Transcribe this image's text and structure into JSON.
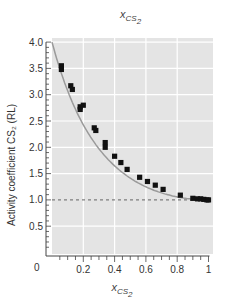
{
  "chart_data": {
    "type": "scatter",
    "xlabel": "x_CS2",
    "ylabel": "Activity coefficient CS2 (RL)",
    "xlim": [
      0,
      1
    ],
    "ylim": [
      0,
      4.0
    ],
    "x_ticks": [
      "0.2",
      "0.4",
      "0.6",
      "0.8",
      "1"
    ],
    "y_ticks": [
      "0.5",
      "1.0",
      "1.5",
      "2.0",
      "2.5",
      "3.0",
      "3.5",
      "4.0"
    ],
    "origin_label": "0",
    "grid": true,
    "reference_line": {
      "y": 1.0,
      "style": "dashed"
    },
    "fit_curve": "smooth decreasing curve from (0, 4.0) to (1, 1.0)",
    "series": [
      {
        "name": "measured",
        "marker": "square",
        "x": [
          0.06,
          0.06,
          0.12,
          0.13,
          0.18,
          0.18,
          0.2,
          0.27,
          0.28,
          0.34,
          0.34,
          0.4,
          0.44,
          0.48,
          0.56,
          0.61,
          0.66,
          0.71,
          0.82,
          0.9,
          0.93,
          0.95,
          0.97,
          0.99,
          1.0
        ],
        "y": [
          3.55,
          3.48,
          3.17,
          3.1,
          2.77,
          2.72,
          2.8,
          2.37,
          2.32,
          2.09,
          2.0,
          1.83,
          1.71,
          1.58,
          1.43,
          1.35,
          1.28,
          1.2,
          1.09,
          1.03,
          1.02,
          1.02,
          1.01,
          1.0,
          1.0
        ]
      }
    ]
  },
  "labels": {
    "top": {
      "base": "x",
      "sub": "CS",
      "subsub": "2"
    },
    "x_axis": {
      "base": "x",
      "sub": "CS",
      "subsub": "2"
    },
    "y_axis": "Activity coefficient CS₂ (RL)",
    "origin": "0"
  },
  "colors": {
    "plot_bg": "#e4e4e4",
    "grid": "#ffffff",
    "marker": "#111111",
    "curve": "#9a9a9a",
    "ref_line": "#555555",
    "axis": "#444444"
  }
}
